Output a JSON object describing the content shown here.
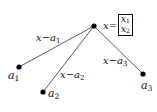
{
  "diagram": {
    "center": {
      "id": "x",
      "label": "x",
      "definition": "x=[x1; x2]",
      "components": [
        "x",
        "x"
      ],
      "subscripts": [
        "1",
        "2"
      ],
      "pos": [
        94,
        26
      ]
    },
    "nodes": [
      {
        "id": "a1",
        "base": "a",
        "sub": "1",
        "pos": [
          19,
          67
        ],
        "label_pos": [
          9,
          70
        ]
      },
      {
        "id": "a2",
        "base": "a",
        "sub": "2",
        "pos": [
          43,
          92
        ],
        "label_pos": [
          49,
          90
        ]
      },
      {
        "id": "a3",
        "base": "a",
        "sub": "3",
        "pos": [
          143,
          74
        ],
        "label_pos": [
          142,
          80
        ]
      }
    ],
    "edges": [
      {
        "from": "x",
        "to": "a1",
        "label_base": "x−a",
        "label_sub": "1",
        "label_pos": [
          36,
          33
        ]
      },
      {
        "from": "x",
        "to": "a2",
        "label_base": "x−a",
        "label_sub": "2",
        "label_pos": [
          60,
          70
        ]
      },
      {
        "from": "x",
        "to": "a3",
        "label_base": "x−a",
        "label_sub": "3",
        "label_pos": [
          103,
          56
        ]
      }
    ],
    "colors": {
      "line": "#333333",
      "dot": "#000000",
      "text": "#111111"
    }
  }
}
